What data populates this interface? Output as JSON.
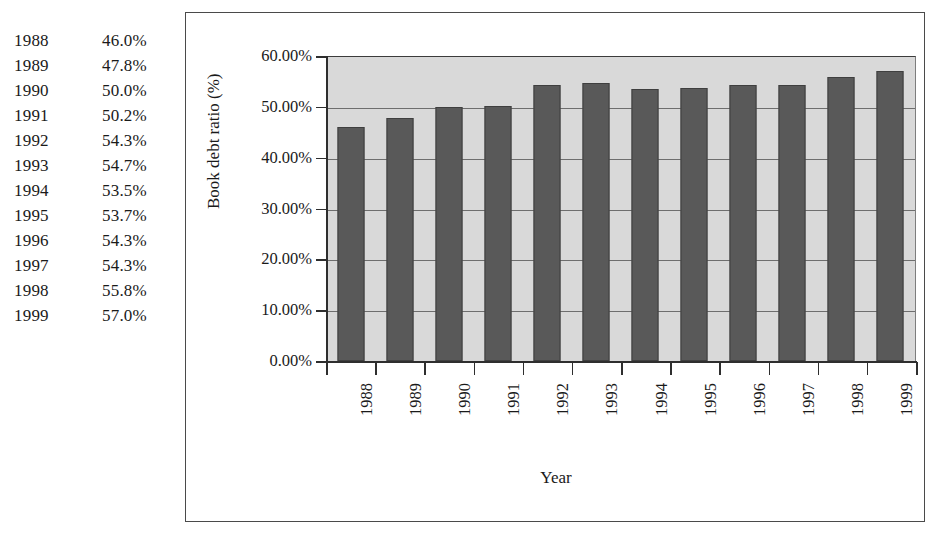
{
  "table": {
    "rows": [
      {
        "year": "1988",
        "value": "46.0%"
      },
      {
        "year": "1989",
        "value": "47.8%"
      },
      {
        "year": "1990",
        "value": "50.0%"
      },
      {
        "year": "1991",
        "value": "50.2%"
      },
      {
        "year": "1992",
        "value": "54.3%"
      },
      {
        "year": "1993",
        "value": "54.7%"
      },
      {
        "year": "1994",
        "value": "53.5%"
      },
      {
        "year": "1995",
        "value": "53.7%"
      },
      {
        "year": "1996",
        "value": "54.3%"
      },
      {
        "year": "1997",
        "value": "54.3%"
      },
      {
        "year": "1998",
        "value": "55.8%"
      },
      {
        "year": "1999",
        "value": "57.0%"
      }
    ]
  },
  "chart_data": {
    "type": "bar",
    "title": "",
    "xlabel": "Year",
    "ylabel": "Book debt ratio (%)",
    "categories": [
      "1988",
      "1989",
      "1990",
      "1991",
      "1992",
      "1993",
      "1994",
      "1995",
      "1996",
      "1997",
      "1998",
      "1999"
    ],
    "values": [
      46.0,
      47.8,
      50.0,
      50.2,
      54.3,
      54.7,
      53.5,
      53.7,
      54.3,
      54.3,
      55.8,
      57.0
    ],
    "ylim": [
      0,
      60
    ],
    "ytick_step": 10,
    "ytick_labels": [
      "0.00%",
      "10.00%",
      "20.00%",
      "30.00%",
      "40.00%",
      "50.00%",
      "60.00%"
    ],
    "ytick_values": [
      0,
      10,
      20,
      30,
      40,
      50,
      60
    ],
    "grid": true,
    "legend": "none",
    "colors": {
      "bar": "#595959",
      "bar_border": "#3f3f3f",
      "plot_background": "#d9d9d9",
      "gridline": "#6e6e6e",
      "axis": "#2e2e2e",
      "frame_border": "#4a4a4a",
      "text": "#1a1a1a"
    }
  }
}
